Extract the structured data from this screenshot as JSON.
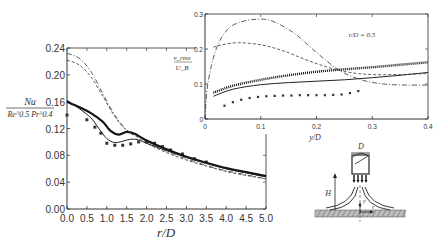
{
  "chart_data": [
    {
      "type": "line",
      "title": "",
      "xlabel": "r/D",
      "ylabel_num": "Nu",
      "ylabel_den": "Re^0.5 Pr^0.4",
      "xlim": [
        0.0,
        5.0
      ],
      "ylim": [
        0.0,
        0.24
      ],
      "xticks": [
        "0.0",
        "0.5",
        "1.0",
        "1.5",
        "2.0",
        "2.5",
        "3.0",
        "3.5",
        "4.0",
        "4.5",
        "5.0"
      ],
      "yticks": [
        "0.00",
        "0.04",
        "0.08",
        "0.12",
        "0.16",
        "0.20",
        "0.24"
      ],
      "grid": false,
      "legend": "none",
      "series": [
        {
          "name": "experiment (squares)",
          "style": "markers",
          "x": [
            0.0,
            0.5,
            0.7,
            0.85,
            1.0,
            1.2,
            1.4,
            1.6,
            1.8,
            2.0,
            2.2,
            2.4,
            2.6,
            2.9,
            3.2,
            3.5
          ],
          "y": [
            0.14,
            0.133,
            0.122,
            0.113,
            0.098,
            0.095,
            0.095,
            0.097,
            0.1,
            0.1,
            0.098,
            0.093,
            0.088,
            0.082,
            0.075,
            0.07
          ]
        },
        {
          "name": "thick solid",
          "style": "solid-thick",
          "x": [
            0.0,
            0.3,
            0.6,
            0.9,
            1.1,
            1.3,
            1.5,
            1.7,
            2.0,
            2.5,
            3.0,
            3.5,
            4.0,
            4.5,
            5.0
          ],
          "y": [
            0.16,
            0.152,
            0.143,
            0.13,
            0.116,
            0.111,
            0.115,
            0.112,
            0.102,
            0.089,
            0.078,
            0.069,
            0.061,
            0.055,
            0.049
          ]
        },
        {
          "name": "thin solid",
          "style": "solid-thin",
          "x": [
            0.0,
            0.3,
            0.6,
            0.8,
            1.0,
            1.2,
            1.4,
            1.6,
            1.8,
            2.0,
            2.5,
            3.0,
            3.5,
            4.0,
            4.5,
            5.0
          ],
          "y": [
            0.162,
            0.15,
            0.136,
            0.12,
            0.105,
            0.099,
            0.101,
            0.104,
            0.103,
            0.098,
            0.087,
            0.077,
            0.068,
            0.06,
            0.054,
            0.048
          ]
        },
        {
          "name": "dash-dot",
          "style": "dash-dot",
          "x": [
            0.0,
            0.3,
            0.6,
            0.9,
            1.2,
            1.5,
            1.8,
            2.0,
            2.5,
            3.0,
            3.5,
            4.0,
            4.5,
            5.0
          ],
          "y": [
            0.232,
            0.225,
            0.205,
            0.172,
            0.14,
            0.118,
            0.108,
            0.1,
            0.086,
            0.075,
            0.065,
            0.057,
            0.051,
            0.045
          ]
        },
        {
          "name": "dashed",
          "style": "dashed",
          "x": [
            0.0,
            0.3,
            0.6,
            0.9,
            1.2,
            1.5,
            1.8,
            2.0,
            2.5,
            3.0,
            3.5,
            4.0,
            4.5,
            5.0
          ],
          "y": [
            0.222,
            0.215,
            0.197,
            0.168,
            0.138,
            0.117,
            0.106,
            0.098,
            0.084,
            0.073,
            0.064,
            0.056,
            0.05,
            0.045
          ]
        }
      ]
    },
    {
      "type": "line",
      "title": "",
      "annotation": "r/D = 0.5",
      "xlabel": "y/D",
      "ylabel_num": "v_rms",
      "ylabel_den": "U_B",
      "xlim": [
        0.0,
        0.4
      ],
      "ylim": [
        0.0,
        0.3
      ],
      "xticks": [
        "0",
        "0.1",
        "0.2",
        "0.3",
        "0.4"
      ],
      "yticks": [
        "0",
        "0.1",
        "0.2",
        "0.3"
      ],
      "grid": false,
      "legend": "none",
      "series": [
        {
          "name": "experiment (squares)",
          "style": "markers",
          "x": [
            0.035,
            0.05,
            0.065,
            0.08,
            0.095,
            0.11,
            0.125,
            0.14,
            0.155,
            0.17,
            0.185,
            0.2,
            0.215,
            0.23,
            0.245,
            0.26,
            0.275
          ],
          "y": [
            0.038,
            0.048,
            0.055,
            0.06,
            0.063,
            0.065,
            0.066,
            0.067,
            0.067,
            0.068,
            0.068,
            0.068,
            0.068,
            0.069,
            0.07,
            0.074,
            0.08
          ]
        },
        {
          "name": "thick dotted",
          "style": "dotted-thick",
          "x": [
            0.015,
            0.05,
            0.1,
            0.15,
            0.2,
            0.25,
            0.3,
            0.35,
            0.4
          ],
          "y": [
            0.075,
            0.095,
            0.112,
            0.125,
            0.135,
            0.142,
            0.148,
            0.155,
            0.162
          ]
        },
        {
          "name": "thin solid",
          "style": "solid-thin",
          "x": [
            0.015,
            0.05,
            0.1,
            0.15,
            0.2,
            0.25,
            0.3,
            0.35,
            0.4
          ],
          "y": [
            0.065,
            0.085,
            0.098,
            0.104,
            0.108,
            0.112,
            0.118,
            0.125,
            0.133
          ]
        },
        {
          "name": "dash-dot",
          "style": "dash-dot",
          "x": [
            0.0,
            0.005,
            0.02,
            0.04,
            0.06,
            0.09,
            0.12,
            0.16,
            0.2,
            0.24,
            0.28,
            0.32,
            0.36,
            0.4
          ],
          "y": [
            0.0,
            0.1,
            0.2,
            0.255,
            0.275,
            0.285,
            0.28,
            0.245,
            0.19,
            0.14,
            0.112,
            0.1,
            0.097,
            0.097
          ]
        },
        {
          "name": "dashed",
          "style": "dashed",
          "x": [
            0.015,
            0.03,
            0.06,
            0.1,
            0.14,
            0.18,
            0.22,
            0.26,
            0.3,
            0.35,
            0.4
          ],
          "y": [
            0.205,
            0.212,
            0.218,
            0.212,
            0.195,
            0.17,
            0.148,
            0.133,
            0.127,
            0.127,
            0.13
          ]
        }
      ]
    }
  ],
  "diagram": {
    "labels": {
      "diameter": "D",
      "height": "H",
      "axial": "y",
      "radial": "r"
    }
  }
}
